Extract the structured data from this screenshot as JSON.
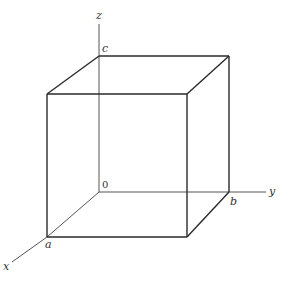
{
  "diagram": {
    "title": "",
    "axes": {
      "x": {
        "label": "x",
        "from": [
          47,
          237
        ],
        "to": [
          12,
          262
        ]
      },
      "y": {
        "label": "y",
        "from": [
          229,
          192
        ],
        "to": [
          266,
          192
        ]
      },
      "z": {
        "label": "z",
        "from": [
          99,
          56
        ],
        "to": [
          99,
          24
        ]
      }
    },
    "origin_label": "0",
    "vertex_labels": {
      "a": "a",
      "b": "b",
      "c": "c"
    },
    "vertices": {
      "O": [
        99,
        192
      ],
      "A": [
        47,
        237
      ],
      "B": [
        229,
        192
      ],
      "C": [
        99,
        56
      ],
      "AB": [
        187,
        237
      ],
      "AC": [
        47,
        94
      ],
      "BC": [
        229,
        56
      ],
      "ABC": [
        187,
        94
      ]
    }
  }
}
